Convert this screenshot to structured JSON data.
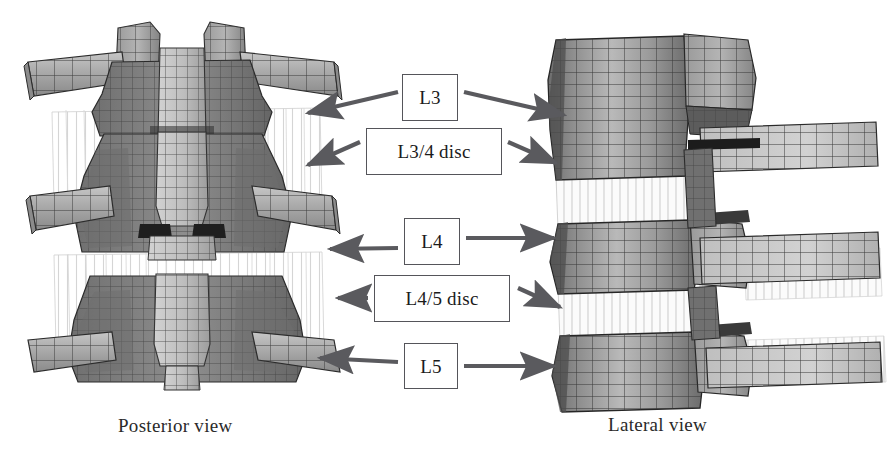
{
  "figure": {
    "background_color": "#ffffff",
    "width": 892,
    "height": 460
  },
  "callouts": [
    {
      "id": "l3",
      "label": "L3",
      "box": {
        "x": 402,
        "y": 74,
        "w": 56,
        "h": 47
      },
      "arrows": [
        {
          "dir": "left",
          "from": [
            398,
            92
          ],
          "to": [
            306,
            114
          ]
        },
        {
          "dir": "right",
          "from": [
            464,
            92
          ],
          "to": [
            566,
            116
          ]
        }
      ]
    },
    {
      "id": "l34disc",
      "label": "L3/4 disc",
      "box": {
        "x": 366,
        "y": 128,
        "w": 136,
        "h": 47
      },
      "arrows": [
        {
          "dir": "left",
          "from": [
            360,
            142
          ],
          "to": [
            306,
            166
          ]
        },
        {
          "dir": "right",
          "from": [
            508,
            142
          ],
          "to": [
            558,
            164
          ]
        }
      ]
    },
    {
      "id": "l4",
      "label": "L4",
      "box": {
        "x": 404,
        "y": 218,
        "w": 56,
        "h": 47
      },
      "arrows": [
        {
          "dir": "left",
          "from": [
            398,
            248
          ],
          "to": [
            328,
            248
          ]
        },
        {
          "dir": "right",
          "from": [
            466,
            238
          ],
          "to": [
            556,
            238
          ]
        }
      ]
    },
    {
      "id": "l45disc",
      "label": "L4/5 disc",
      "box": {
        "x": 374,
        "y": 275,
        "w": 136,
        "h": 47
      },
      "arrows": [
        {
          "dir": "left",
          "from": [
            368,
            298
          ],
          "to": [
            336,
            298
          ]
        },
        {
          "dir": "right",
          "from": [
            518,
            288
          ],
          "to": [
            562,
            308
          ]
        }
      ]
    },
    {
      "id": "l5",
      "label": "L5",
      "box": {
        "x": 404,
        "y": 343,
        "w": 54,
        "h": 46
      },
      "arrows": [
        {
          "dir": "left",
          "from": [
            398,
            362
          ],
          "to": [
            318,
            358
          ]
        },
        {
          "dir": "right",
          "from": [
            464,
            366
          ],
          "to": [
            556,
            366
          ]
        }
      ]
    }
  ],
  "captions": {
    "posterior": {
      "text": "Posterior view",
      "x": 118,
      "y": 415
    },
    "lateral": {
      "text": "Lateral view",
      "x": 608,
      "y": 414
    }
  },
  "colors": {
    "mesh_line": "#3a3a3a",
    "mesh_line_dark": "#1d1d1d",
    "fill_light": "#c9c9c9",
    "fill_mid": "#a2a2a2",
    "fill_dark": "#7d7d7d",
    "fill_darker": "#636363",
    "disc_fiber": "#d8d8d8",
    "arrow": "#5a5a5e",
    "box_border": "#55555a",
    "text": "#1b1b1b"
  },
  "anatomy": {
    "posterior_view": {
      "vertebrae": [
        "L3",
        "L4",
        "L5"
      ],
      "discs": [
        "L3/4 disc",
        "L4/5 disc"
      ],
      "features": [
        "transverse-process",
        "lamina",
        "spinous-process",
        "facet-joint"
      ]
    },
    "lateral_view": {
      "vertebrae": [
        "L3",
        "L4",
        "L5"
      ],
      "discs": [
        "L3/4 disc",
        "L4/5 disc"
      ],
      "features": [
        "vertebral-body",
        "pedicle",
        "facet-joint",
        "spinous-process"
      ]
    }
  }
}
